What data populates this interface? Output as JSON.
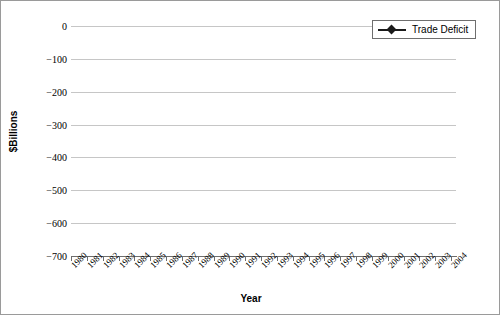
{
  "chart_data": {
    "type": "line",
    "title": "",
    "xlabel": "Year",
    "ylabel": "$Billions",
    "ylim": [
      -700,
      0
    ],
    "yticks": [
      0,
      -100,
      -200,
      -300,
      -400,
      -500,
      -600,
      -700
    ],
    "ytick_labels": [
      "0",
      "-100",
      "-200",
      "-300",
      "-400",
      "-500",
      "-600",
      "-700"
    ],
    "grid": true,
    "legend_position": "top-right",
    "legend": [
      "Trade Deficit"
    ],
    "marker": "diamond",
    "line_color": "#1a1a1a",
    "grid_color": "#c6c6c6",
    "categories": [
      "1980",
      "1981",
      "1982",
      "1983",
      "1984",
      "1985",
      "1986",
      "1987",
      "1988",
      "1989",
      "1990",
      "1991",
      "1992",
      "1993",
      "1994",
      "1995",
      "1996",
      "1997",
      "1998",
      "1999",
      "2000",
      "2001",
      "2002",
      "2003",
      "2004"
    ],
    "series": [
      {
        "name": "Trade Deficit",
        "values": [
          -13,
          -12,
          -20,
          -52,
          -104,
          -115,
          -133,
          -148,
          -111,
          -90,
          -80,
          -31,
          -39,
          -70,
          -98,
          -96,
          -100,
          -104,
          -164,
          -260,
          -380,
          -365,
          -421,
          -496,
          -624
        ]
      }
    ]
  },
  "legend_entry_label": "Trade Deficit"
}
